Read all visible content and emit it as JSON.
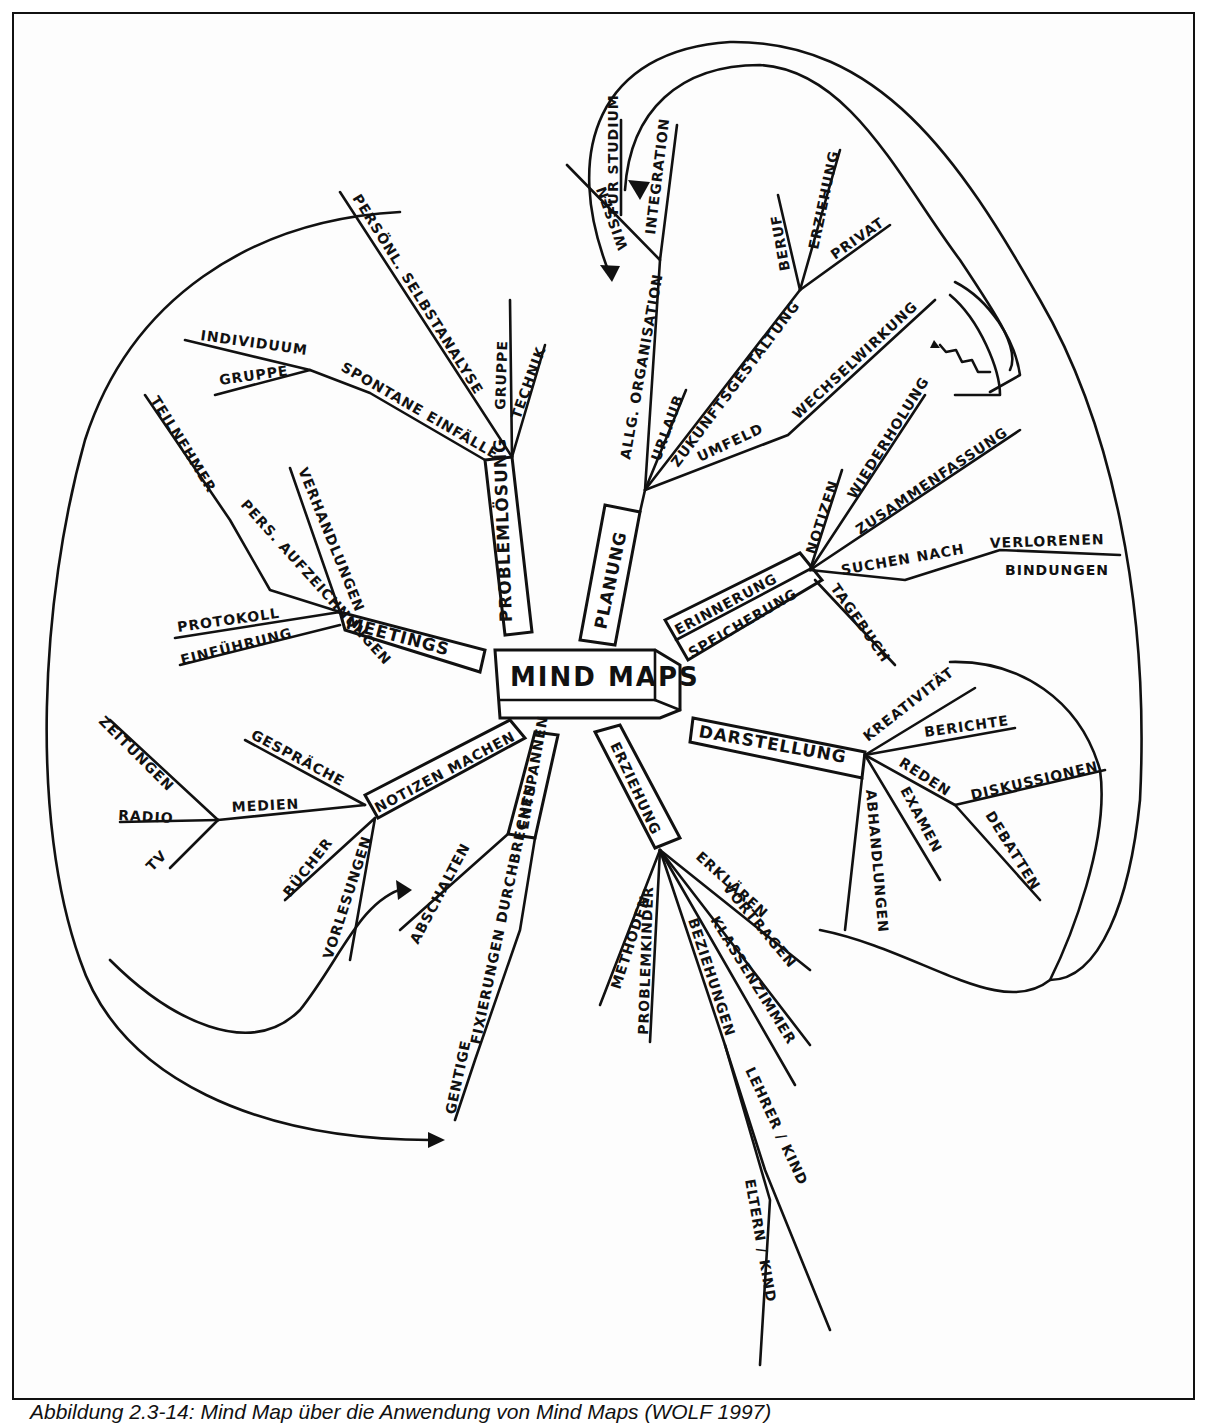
{
  "figure": {
    "caption": "Abbildung 2.3-14: Mind Map über die Anwendung von Mind Maps (WOLF 1997)",
    "center": "MIND MAPS",
    "branches": {
      "planung": {
        "label": "PLANUNG",
        "children": [
          "ALLG. ORGANISATION",
          "URLAUB",
          "ZUKUNFTSGESTALTUNG",
          "UMFELD",
          "WECHSELWIRKUNG",
          "INTEGRATION",
          "WISSEN",
          "FÜR STUDIUM",
          "BERUF",
          "ERZIEHUNG",
          "PRIVAT"
        ]
      },
      "problemloesung": {
        "label": "PROBLEMLÖSUNG",
        "children": [
          "PERSÖNL. SELBSTANALYSE",
          "GRUPPE",
          "TECHNIK",
          "SPONTANE EINFÄLLE",
          "INDIVIDUUM",
          "GRUPPE"
        ]
      },
      "meetings": {
        "label": "MEETINGS",
        "children": [
          "VERHANDLUNGEN",
          "PERS. AUFZEICHNUNGEN",
          "TEILNEHMER",
          "PROTOKOLL",
          "EINFÜHRUNG"
        ]
      },
      "notizen_machen": {
        "label": "NOTIZEN MACHEN",
        "children": [
          "GESPRÄCHE",
          "MEDIEN",
          "ZEITUNGEN",
          "RADIO",
          "TV",
          "BÜCHER",
          "VORLESUNGEN"
        ]
      },
      "entspannen": {
        "label": "ENTSPANNEN",
        "children": [
          "ABSCHALTEN",
          "FIXIERUNGEN DURCHBRECHEN",
          "GENTIGE"
        ]
      },
      "erziehung": {
        "label": "ERZIEHUNG",
        "children": [
          "METHODEN",
          "PROBLEMKINDER",
          "BEZIEHUNGEN",
          "LEHRER / KIND",
          "ELTERN / KIND",
          "KLASSENZIMMER",
          "VORTRAGEN",
          "ERKLÄREN"
        ]
      },
      "darstellung": {
        "label": "DARSTELLUNG",
        "children": [
          "KREATIVITÄT",
          "BERICHTE",
          "REDEN",
          "DISKUSSIONEN",
          "DEBATTEN",
          "EXAMEN",
          "ABHANDLUNGEN"
        ]
      },
      "erinnerung": {
        "label": "ERINNERUNG",
        "label2": "SPEICHERUNG",
        "children": [
          "NOTIZEN",
          "WIEDERHOLUNG",
          "ZUSAMMENFASSUNG",
          "SUCHEN NACH",
          "VERLORENEN",
          "BINDUNGEN",
          "TAGEBUCH"
        ]
      }
    }
  }
}
